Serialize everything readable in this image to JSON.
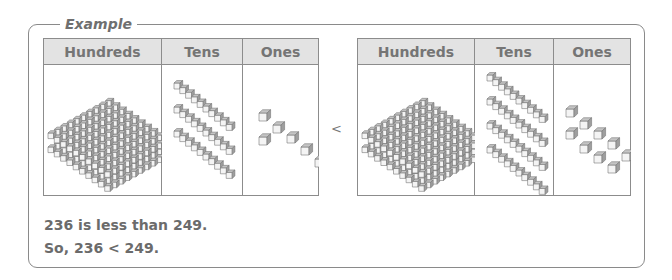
{
  "example": {
    "title": "Example",
    "columns": [
      "Hundreds",
      "Tens",
      "Ones"
    ],
    "left_number": {
      "value": 236,
      "hundreds": 2,
      "tens": 3,
      "ones": 6
    },
    "right_number": {
      "value": 249,
      "hundreds": 2,
      "tens": 4,
      "ones": 9
    },
    "comparison_symbol": "<",
    "statement_1": "236 is less than 249.",
    "statement_2": "So, 236 < 249."
  },
  "colors": {
    "border": "#8a8a8a",
    "header_fill": "#e3e3e3",
    "block_fill": "#b5b5b5",
    "text": "#6b6b6b"
  }
}
